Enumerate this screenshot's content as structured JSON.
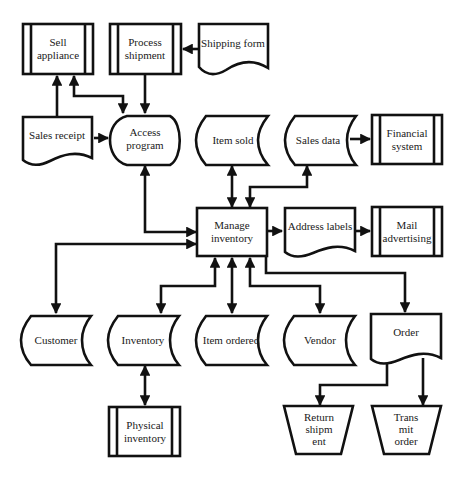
{
  "diagram": {
    "type": "system flowchart",
    "nodes": {
      "sell_appliance": {
        "label1": "Sell",
        "label2": "appliance",
        "shape": "predefined-process"
      },
      "process_shipment": {
        "label1": "Process",
        "label2": "shipment",
        "shape": "predefined-process"
      },
      "shipping_form": {
        "label": "Shipping form",
        "shape": "document"
      },
      "sales_receipt": {
        "label": "Sales receipt",
        "shape": "document"
      },
      "access_program": {
        "label1": "Access",
        "label2": "program",
        "shape": "display"
      },
      "item_sold": {
        "label": "Item sold",
        "shape": "stored-data"
      },
      "sales_data": {
        "label": "Sales data",
        "shape": "stored-data"
      },
      "financial_system": {
        "label1": "Financial",
        "label2": "system",
        "shape": "predefined-process"
      },
      "manage_inventory": {
        "label1": "Manage",
        "label2": "inventory",
        "shape": "process"
      },
      "address_labels": {
        "label": "Address labels",
        "shape": "document"
      },
      "mail_advertising": {
        "label1": "Mail",
        "label2": "advertising",
        "shape": "predefined-process"
      },
      "customer": {
        "label": "Customer",
        "shape": "stored-data"
      },
      "inventory": {
        "label": "Inventory",
        "shape": "stored-data"
      },
      "item_ordered": {
        "label": "Item ordered",
        "shape": "stored-data"
      },
      "vendor": {
        "label": "Vendor",
        "shape": "stored-data"
      },
      "order": {
        "label": "Order",
        "shape": "document"
      },
      "physical_inventory": {
        "label1": "Physical",
        "label2": "inventory",
        "shape": "predefined-process"
      },
      "return_shipment": {
        "label1": "Return",
        "label2": "shipm",
        "label3": "ent",
        "shape": "manual-operation"
      },
      "transmit_order": {
        "label1": "Trans",
        "label2": "mit",
        "label3": "order",
        "shape": "manual-operation"
      }
    },
    "edges": [
      {
        "from": "Sales receipt",
        "to": "Sell appliance"
      },
      {
        "from": "Access program",
        "to": "Sell appliance",
        "bidirectional": true
      },
      {
        "from": "Shipping form",
        "to": "Process shipment"
      },
      {
        "from": "Process shipment",
        "to": "Access program"
      },
      {
        "from": "Sales receipt",
        "to": "Access program"
      },
      {
        "from": "Manage inventory",
        "to": "Access program",
        "bidirectional": true
      },
      {
        "from": "Manage inventory",
        "to": "Item sold",
        "bidirectional": true
      },
      {
        "from": "Manage inventory",
        "to": "Sales data",
        "bidirectional": true
      },
      {
        "from": "Sales data",
        "to": "Financial system"
      },
      {
        "from": "Manage inventory",
        "to": "Address labels"
      },
      {
        "from": "Address labels",
        "to": "Mail advertising"
      },
      {
        "from": "Manage inventory",
        "to": "Customer",
        "bidirectional": true
      },
      {
        "from": "Manage inventory",
        "to": "Inventory",
        "bidirectional": true
      },
      {
        "from": "Manage inventory",
        "to": "Item ordered",
        "bidirectional": true
      },
      {
        "from": "Manage inventory",
        "to": "Vendor",
        "bidirectional": true
      },
      {
        "from": "Manage inventory",
        "to": "Order"
      },
      {
        "from": "Inventory",
        "to": "Physical inventory",
        "bidirectional": true
      },
      {
        "from": "Order",
        "to": "Return shipment"
      },
      {
        "from": "Order",
        "to": "Transmit order"
      }
    ]
  }
}
